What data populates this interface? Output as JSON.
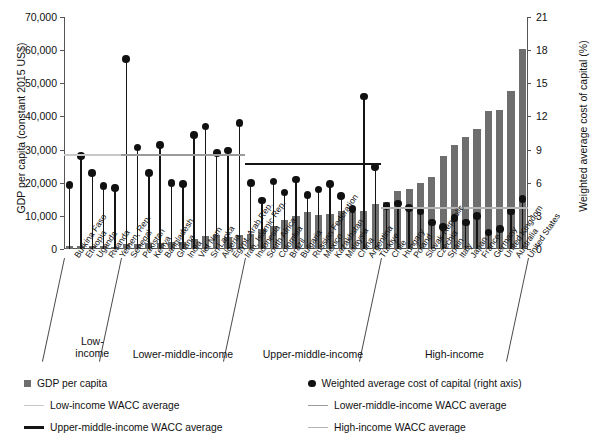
{
  "chart_data": {
    "type": "bar",
    "title": "",
    "ylabel": "GDP per capita (constant 2015 US$)",
    "ylabel_right": "Weighted average cost of capital (%)",
    "xlabel": "",
    "ylim": [
      0,
      70000
    ],
    "yticks": [
      "0",
      "10,000",
      "20,000",
      "30,000",
      "40,000",
      "50,000",
      "60,000",
      "70,000"
    ],
    "ylim_right": [
      0,
      21
    ],
    "yticks_right": [
      "0",
      "3",
      "6",
      "9",
      "12",
      "15",
      "18",
      "21"
    ],
    "grid": false,
    "legend_position": "below",
    "categories": [
      "Burkina Faso",
      "Ethiopia",
      "Uganda",
      "Rwanda",
      "Yemen, Rep.",
      "Senegal",
      "Pakistan",
      "Kenya",
      "Bangladesh",
      "Ghana",
      "India",
      "Viet Nam",
      "Sri Lanka",
      "Algeria",
      "Egypt, Arab Rep.",
      "Iran, Islamic Rep.",
      "Indonesia",
      "South Africa",
      "Colombia",
      "Brazil",
      "Bulgaria",
      "Russian Federation",
      "Mexico",
      "Kazakhstan",
      "Malaysia",
      "China",
      "Argentina",
      "Türkiye",
      "Chile",
      "Hungary",
      "Poland",
      "Slovak Republic",
      "Czechia",
      "Spain",
      "Italy",
      "Japan",
      "France",
      "Germany",
      "United Kingdom",
      "Australia",
      "United States"
    ],
    "series": [
      {
        "name": "GDP per capita",
        "axis": "left",
        "units": "constant 2015 US$",
        "values": [
          820,
          900,
          980,
          880,
          650,
          1500,
          1500,
          1800,
          1700,
          2100,
          2100,
          3000,
          4000,
          4300,
          3600,
          4300,
          4400,
          6100,
          6800,
          8700,
          9900,
          11300,
          10300,
          10500,
          11400,
          11200,
          11500,
          13600,
          14300,
          17500,
          18100,
          20000,
          21600,
          28000,
          31400,
          33800,
          36100,
          41500,
          41900,
          47800,
          60500
        ]
      },
      {
        "name": "Weighted average cost of capital (right axis)",
        "axis": "right",
        "units": "%",
        "values": [
          5.8,
          8.4,
          6.9,
          5.7,
          5.5,
          17.2,
          9.2,
          6.9,
          9.4,
          6.0,
          5.9,
          10.3,
          11.1,
          8.7,
          8.9,
          11.4,
          6.0,
          4.4,
          6.1,
          5.1,
          6.3,
          4.9,
          5.4,
          5.9,
          4.8,
          3.6,
          13.8,
          7.4,
          3.9,
          4.1,
          3.7,
          3.4,
          2.4,
          2.0,
          2.8,
          2.4,
          3.0,
          1.5,
          1.8,
          3.4,
          4.5
        ]
      }
    ],
    "averages": [
      {
        "name": "Low-income WACC average",
        "value": 8.6,
        "color": "#c8c8c8",
        "from_index": 0,
        "to_index": 4
      },
      {
        "name": "Lower-middle-income WACC average",
        "value": 8.6,
        "color": "#9a9a9a",
        "from_index": 5,
        "to_index": 15
      },
      {
        "name": "Upper-middle-income WACC average",
        "value": 7.8,
        "color": "#151515",
        "from_index": 16,
        "to_index": 27
      },
      {
        "name": "High-income WACC average",
        "value": 3.8,
        "color": "#b5b5b5",
        "from_index": 28,
        "to_index": 40
      }
    ],
    "groups": [
      {
        "label": "Low-\nincome",
        "from_index": 0,
        "to_index": 4
      },
      {
        "label": "Lower-middle-income",
        "from_index": 5,
        "to_index": 15
      },
      {
        "label": "Upper-middle-income",
        "from_index": 16,
        "to_index": 27
      },
      {
        "label": "High-income",
        "from_index": 28,
        "to_index": 40
      }
    ]
  },
  "legend": {
    "items": [
      {
        "marker": "square",
        "label": "GDP per capita",
        "color": "#6e6e6e"
      },
      {
        "marker": "dot",
        "label": "Weighted average cost of capital (right axis)",
        "color": "#111111"
      },
      {
        "marker": "line",
        "label": "Low-income WACC average",
        "color": "#c8c8c8"
      },
      {
        "marker": "line",
        "label": "Lower-middle-income WACC average",
        "color": "#9a9a9a"
      },
      {
        "marker": "line",
        "label": "Upper-middle-income WACC average",
        "color": "#151515"
      },
      {
        "marker": "line",
        "label": "High-income WACC average",
        "color": "#b5b5b5"
      }
    ]
  }
}
